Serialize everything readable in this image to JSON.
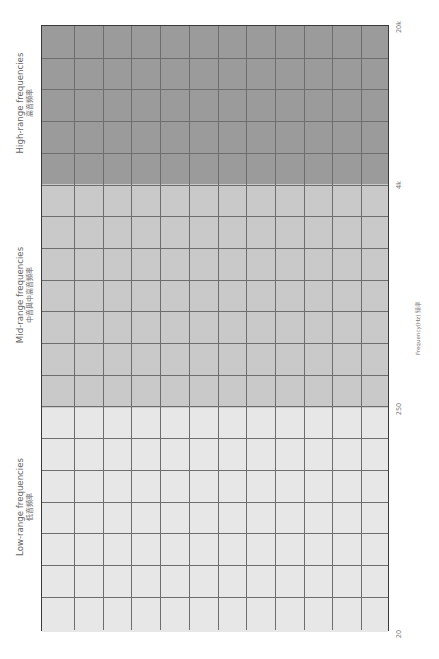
{
  "chart_data": {
    "type": "heatmap",
    "title": "",
    "orientation": "rotated-90ccw",
    "axis": {
      "title": "Frequency(Hz) 频率",
      "ticks": [
        {
          "label": "20",
          "y": 631
        },
        {
          "label": "250",
          "y": 407
        },
        {
          "label": "4k",
          "y": 183
        },
        {
          "label": "20k",
          "y": 25
        }
      ]
    },
    "grid": {
      "columns": 12,
      "rows": 19,
      "line_color": "#6e6e6e",
      "border_color": "#3a3a3a"
    },
    "bands": [
      {
        "name": "high",
        "label_en": "High-range frequencies",
        "label_zh": "高音頻率",
        "range": [
          "4k",
          "20k"
        ],
        "rows": 5,
        "color": "#9b9b9b",
        "top": 0,
        "height": 158
      },
      {
        "name": "mid",
        "label_en": "Mid-range frequencies",
        "label_zh": "中音與中高音頻率",
        "range": [
          "250",
          "4k"
        ],
        "rows": 7,
        "color": "#c9c9c9",
        "top": 158,
        "height": 224
      },
      {
        "name": "low",
        "label_en": "Low-range frequencies",
        "label_zh": "低音頻率",
        "range": [
          "20",
          "250"
        ],
        "rows": 7,
        "color": "#e7e7e7",
        "top": 382,
        "height": 224
      }
    ]
  },
  "labels": {
    "high_en": "High-range frequencies",
    "high_zh": "高音頻率",
    "mid_en": "Mid-range frequencies",
    "mid_zh": "中音與中高音頻率",
    "low_en": "Low-range frequencies",
    "low_zh": "低音頻率",
    "axis_title": "Frequency(Hz) 频率",
    "tick_20k": "20k",
    "tick_4k": "4k",
    "tick_250": "250",
    "tick_20": "20"
  }
}
